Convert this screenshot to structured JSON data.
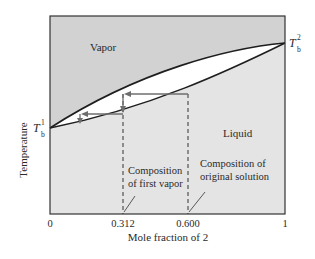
{
  "diagram": {
    "type": "phase-diagram-temperature-composition",
    "regions": {
      "vapor": "Vapor",
      "liquid": "Liquid"
    },
    "y_axis": {
      "label": "Temperature"
    },
    "x_axis": {
      "label": "Mole fraction of 2",
      "ticks": [
        "0",
        "0.312",
        "0.600",
        "1"
      ]
    },
    "boiling_points": {
      "left": {
        "symbol": "T",
        "sub": "b",
        "sup": "1"
      },
      "right": {
        "symbol": "T",
        "sub": "b",
        "sup": "2"
      }
    },
    "annotations": {
      "first_vapor_line1": "Composition",
      "first_vapor_line2": "of first vapor",
      "original_line1": "Composition of",
      "original_line2": "original solution"
    },
    "colors": {
      "vapor_region": "#d2d2d2",
      "liquid_region": "#e4e4e4",
      "lens": "#ffffff",
      "curve": "#1e1e1e",
      "arrow": "#6e6e6e"
    }
  }
}
